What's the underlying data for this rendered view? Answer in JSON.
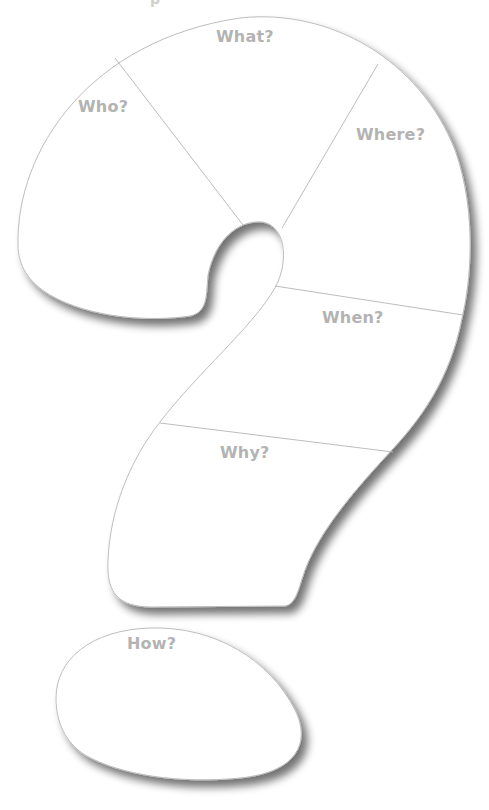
{
  "header": {
    "fragment": "p"
  },
  "diagram": {
    "type": "question-mark graphic organizer",
    "sections": [
      {
        "id": "who",
        "label": "Who?"
      },
      {
        "id": "what",
        "label": "What?"
      },
      {
        "id": "where",
        "label": "Where?"
      },
      {
        "id": "when",
        "label": "When?"
      },
      {
        "id": "why",
        "label": "Why?"
      },
      {
        "id": "how",
        "label": "How?"
      }
    ]
  },
  "colors": {
    "outline": "#bdbdbd",
    "label": "#b3b3b3",
    "fill": "#ffffff",
    "shadow": "#7a7a7a"
  }
}
